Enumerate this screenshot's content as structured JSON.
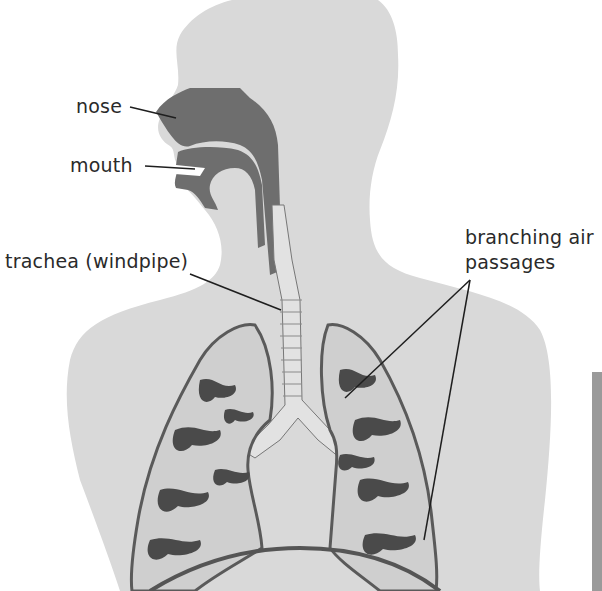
{
  "diagram": {
    "labels": {
      "nose": "nose",
      "mouth": "mouth",
      "trachea": "trachea (windpipe)",
      "branching_line1": "branching air",
      "branching_line2": "passages"
    },
    "colors": {
      "body": "#d9d9d9",
      "airway": "#6e6e6e",
      "lung_fill": "#cfcfcf",
      "lung_dark": "#4a4a4a",
      "trachea": "#e2e2e2",
      "leader_line": "#1e1e1e",
      "background": "#ffffff"
    }
  }
}
